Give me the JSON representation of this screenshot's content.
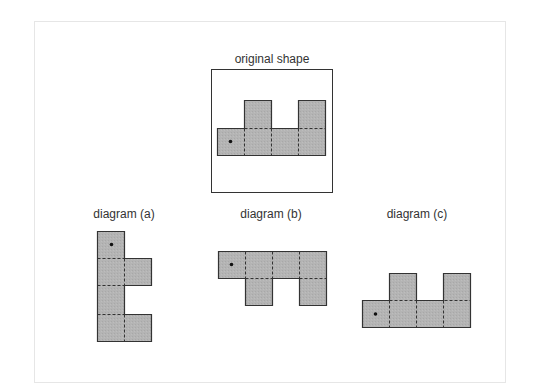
{
  "figure": {
    "original_label": "original shape",
    "diagram_a_label": "diagram (a)",
    "diagram_b_label": "diagram (b)",
    "diagram_c_label": "diagram (c)"
  },
  "colors": {
    "square_fill": "#b4b4b4",
    "square_stroke": "#333333",
    "dashed_line": "#333333",
    "frame_border": "#e6e6e6",
    "box_border": "#333333"
  },
  "shapes": {
    "square_size": 27,
    "original": {
      "squares": [
        [
          0,
          1
        ],
        [
          1,
          1
        ],
        [
          2,
          1
        ],
        [
          3,
          1
        ],
        [
          1,
          0
        ],
        [
          3,
          0
        ]
      ],
      "dot_square": [
        0,
        1
      ]
    },
    "diagram_a": {
      "squares": [
        [
          0,
          0
        ],
        [
          0,
          1
        ],
        [
          0,
          2
        ],
        [
          0,
          3
        ],
        [
          1,
          1
        ],
        [
          1,
          3
        ]
      ],
      "dot_square": [
        0,
        0
      ]
    },
    "diagram_b": {
      "squares": [
        [
          0,
          0
        ],
        [
          1,
          0
        ],
        [
          2,
          0
        ],
        [
          3,
          0
        ],
        [
          1,
          1
        ],
        [
          3,
          1
        ]
      ],
      "dot_square": [
        0,
        0
      ]
    },
    "diagram_c": {
      "squares": [
        [
          0,
          1
        ],
        [
          1,
          1
        ],
        [
          2,
          1
        ],
        [
          3,
          1
        ],
        [
          1,
          0
        ],
        [
          3,
          0
        ]
      ],
      "dot_square": [
        0,
        1
      ]
    }
  }
}
